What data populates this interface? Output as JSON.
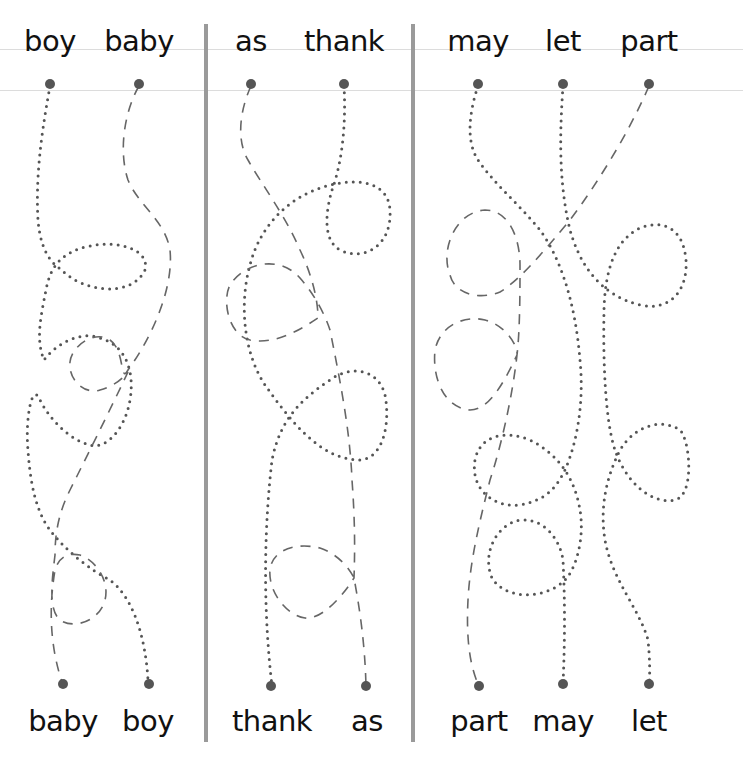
{
  "worksheet": {
    "instructions_visible": false,
    "colors": {
      "dot": "#555555",
      "divider": "#9a9a9a",
      "guideline": "#dcdcdc",
      "text": "#111111"
    },
    "panels": [
      {
        "id": "panel-1",
        "top_words": [
          "boy",
          "baby"
        ],
        "bottom_words": [
          "baby",
          "boy"
        ],
        "paths": [
          {
            "from": "boy",
            "to": "boy",
            "style": "dotted"
          },
          {
            "from": "baby",
            "to": "baby",
            "style": "dashed"
          }
        ]
      },
      {
        "id": "panel-2",
        "top_words": [
          "as",
          "thank"
        ],
        "bottom_words": [
          "thank",
          "as"
        ],
        "paths": [
          {
            "from": "thank",
            "to": "thank",
            "style": "dotted"
          },
          {
            "from": "as",
            "to": "as",
            "style": "dashed"
          }
        ]
      },
      {
        "id": "panel-3",
        "top_words": [
          "may",
          "let",
          "part"
        ],
        "bottom_words": [
          "part",
          "may",
          "let"
        ],
        "paths": [
          {
            "from": "may",
            "to": "may",
            "style": "dotted"
          },
          {
            "from": "let",
            "to": "let",
            "style": "dotted"
          },
          {
            "from": "part",
            "to": "part",
            "style": "dashed"
          }
        ]
      }
    ]
  }
}
